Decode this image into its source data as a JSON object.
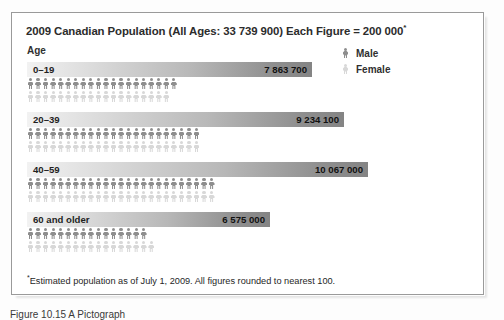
{
  "figure": {
    "title": "2009 Canadian Population (All Ages: 33 739 900) Each Figure = 200 000",
    "title_star": "*",
    "age_header": "Age",
    "footnote_star": "*",
    "footnote": "Estimated population as of July 1, 2009. All figures rounded to nearest 100.",
    "caption": "Figure 10.15  A Pictograph"
  },
  "legend": {
    "items": [
      {
        "label": "Male",
        "icon": "male-figure-icon",
        "color": "#8e8e8e"
      },
      {
        "label": "Female",
        "icon": "female-figure-icon",
        "color": "#d8d8d8"
      }
    ]
  },
  "colors": {
    "male": "#8e8e8e",
    "female": "#d8d8d8",
    "bar_light": "#f2f2f2",
    "bar_dark": "#848484",
    "frame_border": "#9a9a9a"
  },
  "chart_data": {
    "type": "bar",
    "title": "2009 Canadian Population (All Ages: 33 739 900) Each Figure = 200 000",
    "xlabel": "",
    "ylabel": "Age",
    "legend_position": "top-right",
    "grid": false,
    "unit_per_figure": 200000,
    "total_population": 33739900,
    "categories": [
      "0–19",
      "20–39",
      "40–59",
      "60 and older"
    ],
    "values": [
      7863700,
      9234100,
      10067000,
      6575000
    ],
    "value_labels": [
      "7 863 700",
      "9 234 100",
      "10 067 000",
      "6 575 000"
    ],
    "bar_widths_px": [
      285,
      317,
      341,
      243
    ],
    "series": [
      {
        "name": "Male",
        "figures": [
          20,
          23,
          25,
          16
        ]
      },
      {
        "name": "Female",
        "figures": [
          19,
          23,
          25,
          17
        ]
      }
    ]
  }
}
